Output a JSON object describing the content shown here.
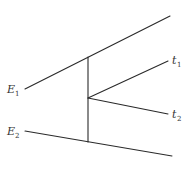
{
  "diagram": {
    "stroke_color": "#2a2a2a",
    "background": "#ffffff",
    "lines": [
      {
        "id": "E1-line",
        "x1": 25,
        "y1": 89,
        "x2": 170,
        "y2": 16
      },
      {
        "id": "E2-line",
        "x1": 25,
        "y1": 131,
        "x2": 172,
        "y2": 156
      },
      {
        "id": "vertical-connector",
        "x1": 88,
        "y1": 57,
        "x2": 88,
        "y2": 142
      },
      {
        "id": "t1-branch",
        "x1": 88,
        "y1": 98,
        "x2": 168,
        "y2": 61
      },
      {
        "id": "t2-branch",
        "x1": 88,
        "y1": 98,
        "x2": 168,
        "y2": 114
      }
    ],
    "labels": {
      "E1": {
        "main": "E",
        "sub": "1"
      },
      "E2": {
        "main": "E",
        "sub": "2"
      },
      "t1": {
        "main": "t",
        "sub": "1"
      },
      "t2": {
        "main": "t",
        "sub": "2"
      }
    }
  }
}
